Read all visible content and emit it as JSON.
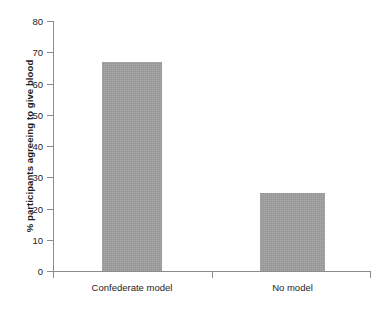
{
  "chart_data": {
    "type": "bar",
    "title": "",
    "xlabel": "",
    "ylabel": "% participants agreeing to give blood",
    "categories": [
      "Confederate model",
      "No model"
    ],
    "values": [
      67,
      25
    ],
    "series": [
      {
        "name": "% participants agreeing to give blood",
        "values": [
          67,
          25
        ]
      }
    ],
    "ylim": [
      0,
      80
    ],
    "ytick_labels": [
      "0",
      "10",
      "20",
      "30",
      "40",
      "50",
      "60",
      "70",
      "80"
    ],
    "ytick_values": [
      0,
      10,
      20,
      30,
      40,
      50,
      60,
      70,
      80
    ],
    "grid": false,
    "legend": false,
    "legend_position": "none",
    "bar_color": "#9e9e9e",
    "axis_color": "#8c8c8c",
    "text_color": "#1d1d1d",
    "background_color": "#ffffff"
  }
}
